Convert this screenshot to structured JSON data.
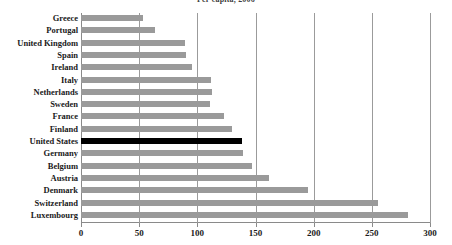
{
  "chart_data": {
    "type": "bar",
    "orientation": "horizontal",
    "title": "Per capita, 2006",
    "xlabel": "",
    "ylabel": "",
    "xlim": [
      0,
      300
    ],
    "xticks": [
      0,
      50,
      100,
      150,
      200,
      250,
      300
    ],
    "gridlines": [
      50,
      100,
      150,
      200,
      250,
      300
    ],
    "grid": true,
    "legend": "none",
    "categories": [
      "Greece",
      "Portugal",
      "United Kingdom",
      "Spain",
      "Ireland",
      "Italy",
      "Netherlands",
      "Sweden",
      "France",
      "Finland",
      "United States",
      "Germany",
      "Belgium",
      "Austria",
      "Denmark",
      "Switzerland",
      "Luxembourg"
    ],
    "values": [
      53,
      64,
      89,
      90,
      95,
      112,
      113,
      111,
      123,
      130,
      138,
      139,
      147,
      162,
      195,
      255,
      281
    ],
    "highlight_category": "United States",
    "colors": {
      "bar": "#9a9a9a",
      "highlight_bar": "#000000",
      "grid": "#9b9b9b",
      "axis": "#8a8a8a",
      "text": "#1a1a1a",
      "background": "#ffffff"
    }
  }
}
